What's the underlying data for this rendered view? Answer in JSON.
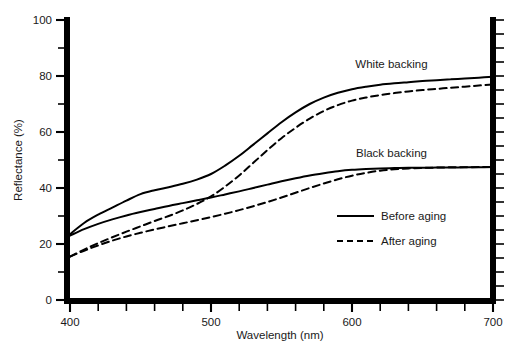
{
  "chart_data": {
    "type": "line",
    "title": "",
    "xlabel": "Wavelength (nm)",
    "ylabel": "Reflectance (%)",
    "xlim": [
      400,
      700
    ],
    "ylim": [
      0,
      100
    ],
    "grid": false,
    "legend_position": "inside-right-lower",
    "x_major_ticks": [
      400,
      500,
      600,
      700
    ],
    "x_major_tick_labels": [
      "400",
      "500",
      "600",
      "700"
    ],
    "x_minor_tick_step": 20,
    "y_major_ticks": [
      0,
      20,
      40,
      60,
      80,
      100
    ],
    "y_major_tick_labels": [
      "0",
      "20",
      "40",
      "60",
      "80",
      "100"
    ],
    "y_minor_ticks": [
      10,
      30,
      50,
      70,
      90
    ],
    "y_right_tick_step": 5,
    "x": [
      400,
      410,
      420,
      430,
      440,
      450,
      460,
      470,
      480,
      490,
      500,
      510,
      520,
      530,
      540,
      550,
      560,
      570,
      580,
      590,
      600,
      610,
      620,
      630,
      640,
      650,
      660,
      670,
      680,
      690,
      700
    ],
    "series": [
      {
        "name": "White backing, Before aging",
        "backing": "White backing",
        "aging": "Before aging",
        "style": "solid",
        "color": "#000000",
        "values": [
          23.5,
          27.5,
          30.5,
          33.0,
          35.5,
          37.8,
          39.2,
          40.3,
          41.5,
          43.0,
          45.0,
          48.0,
          51.5,
          55.5,
          59.5,
          63.5,
          67.0,
          70.0,
          72.3,
          74.0,
          75.3,
          76.2,
          76.9,
          77.4,
          77.8,
          78.2,
          78.5,
          78.8,
          79.1,
          79.4,
          79.7
        ]
      },
      {
        "name": "White backing, After aging",
        "backing": "White backing",
        "aging": "After aging",
        "style": "dashed",
        "color": "#000000",
        "values": [
          15.5,
          18.0,
          20.3,
          22.4,
          24.4,
          26.3,
          28.2,
          30.0,
          32.0,
          34.3,
          37.0,
          40.5,
          44.5,
          49.0,
          53.5,
          57.8,
          61.5,
          64.8,
          67.5,
          69.6,
          71.2,
          72.3,
          73.2,
          73.9,
          74.5,
          75.0,
          75.4,
          75.8,
          76.2,
          76.6,
          77.0
        ]
      },
      {
        "name": "Black backing, Before aging",
        "backing": "Black backing",
        "aging": "Before aging",
        "style": "solid",
        "color": "#000000",
        "values": [
          23.0,
          25.3,
          27.2,
          28.8,
          30.2,
          31.4,
          32.5,
          33.6,
          34.6,
          35.6,
          36.6,
          37.7,
          38.8,
          40.0,
          41.2,
          42.4,
          43.5,
          44.5,
          45.3,
          46.0,
          46.5,
          46.8,
          47.0,
          47.1,
          47.2,
          47.2,
          47.3,
          47.3,
          47.4,
          47.4,
          47.5
        ]
      },
      {
        "name": "Black backing, After aging",
        "backing": "Black backing",
        "aging": "After aging",
        "style": "dashed",
        "color": "#000000",
        "values": [
          15.5,
          17.6,
          19.5,
          21.2,
          22.7,
          24.0,
          25.2,
          26.3,
          27.4,
          28.5,
          29.6,
          30.8,
          32.1,
          33.5,
          35.0,
          36.6,
          38.3,
          40.0,
          41.6,
          43.1,
          44.4,
          45.4,
          46.2,
          46.7,
          47.0,
          47.2,
          47.3,
          47.4,
          47.4,
          47.5,
          47.5
        ]
      }
    ],
    "annotations": [
      {
        "text": "White backing",
        "x": 628,
        "y": 83
      },
      {
        "text": "Black backing",
        "x": 628,
        "y": 51
      }
    ],
    "legend": [
      {
        "label": "Before aging",
        "style": "solid"
      },
      {
        "label": "After aging",
        "style": "dashed"
      }
    ]
  }
}
